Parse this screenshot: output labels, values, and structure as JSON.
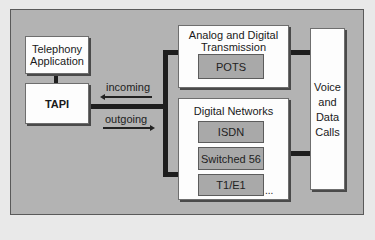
{
  "diagram": {
    "telephony_app": {
      "line1": "Telephony",
      "line2": "Application"
    },
    "tapi": {
      "label": "TAPI"
    },
    "flows": {
      "incoming": "incoming",
      "outgoing": "outgoing"
    },
    "analog_digital": {
      "title_line1": "Analog and Digital",
      "title_line2": "Transmission",
      "items": [
        "POTS"
      ]
    },
    "digital_networks": {
      "title": "Digital Networks",
      "items": [
        "ISDN",
        "Switched 56",
        "T1/E1"
      ],
      "more": "..."
    },
    "voice_data": {
      "lines": [
        "Voice",
        "and",
        "Data",
        "Calls"
      ]
    },
    "colors": {
      "frame_fill": "#b3b3b3",
      "box_fill": "#fdfdfd",
      "inner_fill": "#a9a9a9",
      "connector": "#1e1e1e"
    }
  }
}
